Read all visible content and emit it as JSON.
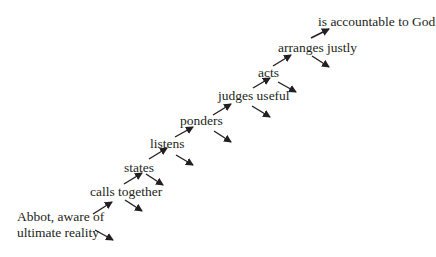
{
  "diagram": {
    "type": "staircase-flow",
    "steps": [
      {
        "id": "abbot",
        "label_lines": [
          "Abbot, aware of",
          "ultimate reality"
        ]
      },
      {
        "id": "calls-together",
        "label": "calls together"
      },
      {
        "id": "states",
        "label": "states"
      },
      {
        "id": "listens",
        "label": "listens"
      },
      {
        "id": "ponders",
        "label": "ponders"
      },
      {
        "id": "judges-useful",
        "label": "judges useful"
      },
      {
        "id": "acts",
        "label": "acts"
      },
      {
        "id": "arranges-justly",
        "label": "arranges justly"
      },
      {
        "id": "accountable",
        "label": "is accountable to God"
      }
    ],
    "arrow_color": "#231f20"
  }
}
